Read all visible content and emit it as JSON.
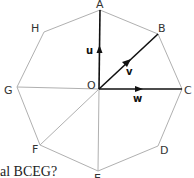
{
  "diagram": {
    "shape": "regular octagon",
    "center_label": "O",
    "vertices": [
      {
        "label": "A",
        "x": 100,
        "y": 10
      },
      {
        "label": "B",
        "x": 158,
        "y": 34
      },
      {
        "label": "C",
        "x": 182,
        "y": 89
      },
      {
        "label": "D",
        "x": 158,
        "y": 146
      },
      {
        "label": "E",
        "x": 98,
        "y": 171
      },
      {
        "label": "F",
        "x": 40,
        "y": 145
      },
      {
        "label": "G",
        "x": 17,
        "y": 87
      },
      {
        "label": "H",
        "x": 44,
        "y": 32
      }
    ],
    "vectors": [
      {
        "label": "u",
        "from": "O",
        "to": "A"
      },
      {
        "label": "v",
        "from": "O",
        "to": "B"
      },
      {
        "label": "w",
        "from": "O",
        "to": "C"
      }
    ],
    "gray_segments": [
      "OG",
      "OF",
      "OE"
    ],
    "colors": {
      "outline": "#b0b0b0",
      "vector": "#111111"
    }
  },
  "question_fragment": "al BCEG?"
}
